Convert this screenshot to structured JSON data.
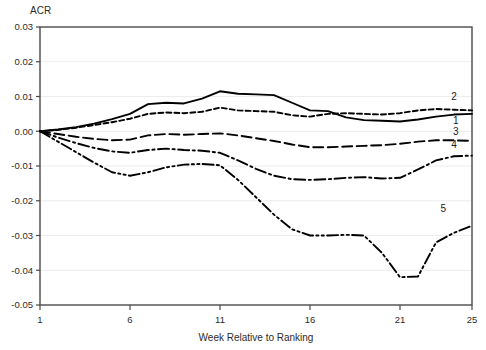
{
  "chart_data": {
    "type": "line",
    "title": "",
    "ylabel": "ACR",
    "xlabel": "Week Relative to Ranking",
    "xlim": [
      1,
      25
    ],
    "ylim": [
      -0.05,
      0.03
    ],
    "grid": true,
    "legend_position": "right-inline-labels",
    "xticks": [
      1,
      6,
      11,
      16,
      21,
      25
    ],
    "xtick_labels": [
      "1",
      "6",
      "11",
      "16",
      "21",
      "25"
    ],
    "yticks": [
      0.03,
      0.02,
      0.01,
      0.0,
      -0.01,
      -0.02,
      -0.03,
      -0.04,
      -0.05
    ],
    "ytick_labels": [
      "0.03",
      "0.02",
      "0.01",
      "0.00",
      "-0.01",
      "-0.02",
      "-0.03",
      "-0.04",
      "-0.05"
    ],
    "x": [
      1,
      2,
      3,
      4,
      5,
      6,
      7,
      8,
      9,
      10,
      11,
      12,
      13,
      14,
      15,
      16,
      17,
      18,
      19,
      20,
      21,
      22,
      23,
      24,
      25
    ],
    "series": [
      {
        "name": "1",
        "label": "1",
        "style": "solid",
        "color": "#000000",
        "values": [
          0.0,
          0.0005,
          0.0012,
          0.0022,
          0.0035,
          0.005,
          0.0078,
          0.0082,
          0.008,
          0.0094,
          0.0115,
          0.0108,
          0.0106,
          0.0104,
          0.0082,
          0.006,
          0.0058,
          0.004,
          0.0032,
          0.003,
          0.0028,
          0.0034,
          0.0042,
          0.0048,
          0.005
        ]
      },
      {
        "name": "2",
        "label": "2",
        "style": "short-dash",
        "color": "#000000",
        "values": [
          0.0,
          0.0004,
          0.001,
          0.0018,
          0.0026,
          0.0036,
          0.005,
          0.0054,
          0.0052,
          0.0056,
          0.0068,
          0.006,
          0.0058,
          0.0056,
          0.0046,
          0.0042,
          0.005,
          0.0052,
          0.005,
          0.0048,
          0.0052,
          0.006,
          0.0064,
          0.0062,
          0.006
        ]
      },
      {
        "name": "3",
        "label": "3",
        "style": "long-dash",
        "color": "#000000",
        "values": [
          0.0,
          -0.0008,
          -0.0016,
          -0.0022,
          -0.0026,
          -0.0024,
          -0.0012,
          -0.0008,
          -0.001,
          -0.0008,
          -0.0006,
          -0.0012,
          -0.002,
          -0.0028,
          -0.0038,
          -0.0046,
          -0.0046,
          -0.0044,
          -0.0042,
          -0.004,
          -0.0036,
          -0.003,
          -0.0026,
          -0.0026,
          -0.0028
        ]
      },
      {
        "name": "4",
        "label": "4",
        "style": "dash-dot",
        "color": "#000000",
        "values": [
          0.0,
          -0.0018,
          -0.0034,
          -0.0048,
          -0.0058,
          -0.0062,
          -0.0054,
          -0.005,
          -0.0054,
          -0.0056,
          -0.0062,
          -0.0084,
          -0.0108,
          -0.0128,
          -0.0138,
          -0.014,
          -0.0138,
          -0.0134,
          -0.0132,
          -0.0136,
          -0.0134,
          -0.011,
          -0.0084,
          -0.0072,
          -0.007
        ]
      },
      {
        "name": "5",
        "label": "5",
        "style": "dash-dot-dot",
        "color": "#000000",
        "values": [
          0.0,
          -0.003,
          -0.006,
          -0.009,
          -0.0118,
          -0.0128,
          -0.0118,
          -0.0104,
          -0.0096,
          -0.0094,
          -0.0098,
          -0.014,
          -0.019,
          -0.024,
          -0.0282,
          -0.03,
          -0.03,
          -0.0298,
          -0.03,
          -0.035,
          -0.042,
          -0.0418,
          -0.032,
          -0.0292,
          -0.0272
        ]
      }
    ],
    "series_label_points": [
      {
        "label": "2",
        "x": 24.0,
        "y": 0.009
      },
      {
        "label": "1",
        "x": 24.1,
        "y": 0.0022
      },
      {
        "label": "3",
        "x": 24.1,
        "y": -0.0012
      },
      {
        "label": "4",
        "x": 24.0,
        "y": -0.0048
      },
      {
        "label": "5",
        "x": 23.4,
        "y": -0.0232
      }
    ]
  }
}
